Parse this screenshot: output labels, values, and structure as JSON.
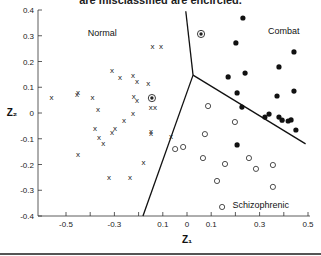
{
  "caption": "are misclassified are encircled.",
  "chart_data": {
    "type": "scatter",
    "title": "",
    "xlabel": "Z₁",
    "ylabel": "Z₂",
    "xlim": [
      -0.6,
      0.5
    ],
    "ylim": [
      -0.4,
      0.4
    ],
    "grid": false,
    "x_ticks": [
      {
        "value": -0.5,
        "label": "-0.5"
      },
      {
        "value": -0.4,
        "label": ""
      },
      {
        "value": -0.3,
        "label": "-0.3"
      },
      {
        "value": -0.2,
        "label": ""
      },
      {
        "value": -0.1,
        "label": "0.1"
      },
      {
        "value": 0.0,
        "label": "0"
      },
      {
        "value": 0.1,
        "label": "0.1"
      },
      {
        "value": 0.2,
        "label": ""
      },
      {
        "value": 0.3,
        "label": "0.3"
      },
      {
        "value": 0.4,
        "label": ""
      },
      {
        "value": 0.5,
        "label": "0.5"
      }
    ],
    "y_ticks": [
      {
        "value": 0.4,
        "label": "0.4"
      },
      {
        "value": 0.3,
        "label": "0.3"
      },
      {
        "value": 0.2,
        "label": "0.2"
      },
      {
        "value": 0.1,
        "label": "0.1"
      },
      {
        "value": 0.0,
        "label": "0"
      },
      {
        "value": -0.1,
        "label": "-0.1"
      },
      {
        "value": -0.2,
        "label": "-0.2"
      },
      {
        "value": -0.3,
        "label": "-0.3"
      },
      {
        "value": -0.4,
        "label": "-0.4"
      }
    ],
    "region_labels": [
      {
        "text": "Normal",
        "x": -0.35,
        "y": 0.3
      },
      {
        "text": "Combat",
        "x": 0.4,
        "y": 0.305
      },
      {
        "text": "Schizophrenic",
        "x": 0.305,
        "y": -0.37
      }
    ],
    "boundaries": [
      {
        "name": "normal-combat",
        "points": [
          [
            -0.005,
            0.395
          ],
          [
            0.025,
            0.147
          ]
        ]
      },
      {
        "name": "normal-schizophrenic",
        "points": [
          [
            0.025,
            0.147
          ],
          [
            -0.182,
            -0.4
          ]
        ]
      },
      {
        "name": "combat-schizophrenic",
        "points": [
          [
            0.025,
            0.147
          ],
          [
            0.49,
            -0.12
          ]
        ]
      }
    ],
    "series": [
      {
        "name": "Normal",
        "marker": "x",
        "points": [
          [
            -0.56,
            0.06
          ],
          [
            -0.455,
            0.07
          ],
          [
            -0.45,
            0.08
          ],
          [
            -0.39,
            0.06
          ],
          [
            -0.368,
            0.012
          ],
          [
            -0.38,
            -0.062
          ],
          [
            -0.364,
            -0.094
          ],
          [
            -0.346,
            -0.12
          ],
          [
            -0.31,
            0.165
          ],
          [
            -0.277,
            0.137
          ],
          [
            -0.223,
            0.144
          ],
          [
            -0.207,
            0.124
          ],
          [
            -0.22,
            0.066
          ],
          [
            -0.207,
            0.05
          ],
          [
            -0.223,
            0.0
          ],
          [
            -0.26,
            -0.03
          ],
          [
            -0.31,
            -0.074
          ],
          [
            -0.298,
            -0.062
          ],
          [
            -0.45,
            -0.16
          ],
          [
            -0.18,
            -0.194
          ],
          [
            -0.16,
            0.113
          ],
          [
            -0.143,
            0.26
          ],
          [
            -0.107,
            0.26
          ],
          [
            -0.15,
            0.02
          ],
          [
            -0.132,
            0.02
          ],
          [
            -0.149,
            -0.07
          ],
          [
            -0.149,
            -0.078
          ],
          [
            -0.066,
            -0.093
          ],
          [
            -0.322,
            -0.252
          ],
          [
            -0.236,
            -0.252
          ]
        ]
      },
      {
        "name": "Combat",
        "marker": "filled-circle",
        "points": [
          [
            0.231,
            0.369
          ],
          [
            0.202,
            0.272
          ],
          [
            0.442,
            0.237
          ],
          [
            0.38,
            0.179
          ],
          [
            0.24,
            0.155
          ],
          [
            0.17,
            0.14
          ],
          [
            0.207,
            0.078
          ],
          [
            0.372,
            0.066
          ],
          [
            0.442,
            0.085
          ],
          [
            0.227,
            0.023
          ],
          [
            0.322,
            -0.016
          ],
          [
            0.339,
            -0.004
          ],
          [
            0.38,
            -0.016
          ],
          [
            0.393,
            -0.028
          ],
          [
            0.418,
            -0.031
          ],
          [
            0.43,
            -0.027
          ],
          [
            0.45,
            -0.066
          ],
          [
            0.207,
            -0.124
          ]
        ]
      },
      {
        "name": "Schizophrenic",
        "marker": "open-circle",
        "points": [
          [
            0.087,
            0.027
          ],
          [
            0.198,
            -0.035
          ],
          [
            0.074,
            -0.082
          ],
          [
            -0.049,
            -0.14
          ],
          [
            -0.016,
            -0.132
          ],
          [
            0.066,
            -0.175
          ],
          [
            0.157,
            -0.198
          ],
          [
            0.256,
            -0.175
          ],
          [
            0.285,
            -0.217
          ],
          [
            0.355,
            -0.202
          ],
          [
            0.124,
            -0.264
          ],
          [
            0.355,
            -0.287
          ],
          [
            0.145,
            -0.365
          ]
        ]
      },
      {
        "name": "Misclassified",
        "marker": "encircled",
        "points": [
          {
            "x": -0.145,
            "y": 0.058,
            "class": "Normal"
          },
          {
            "x": 0.058,
            "y": 0.307,
            "class": "Combat"
          }
        ]
      }
    ]
  }
}
